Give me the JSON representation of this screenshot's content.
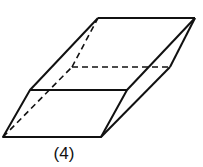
{
  "figure": {
    "label": "(4)",
    "stroke_color": "#111111",
    "vertices": {
      "A": [
        3,
        137
      ],
      "B": [
        101,
        137
      ],
      "C": [
        30,
        90
      ],
      "D": [
        127,
        90
      ],
      "E": [
        98,
        18
      ],
      "F": [
        195,
        18
      ],
      "G": [
        72,
        67
      ],
      "H": [
        170,
        67
      ]
    }
  }
}
